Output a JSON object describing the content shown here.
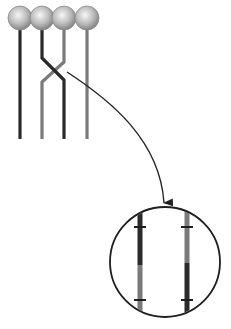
{
  "diagram": {
    "type": "genetics-crossing-over",
    "colors": {
      "dark_chromatid": "#2a2a2a",
      "light_chromatid": "#7a7a7a",
      "centromere_light": "#f4f4f4",
      "centromere_dark": "#8a8a8a",
      "arrow": "#222222",
      "circle_outline": "#1e1e1e",
      "background": "#ffffff"
    },
    "centromeres": [
      {
        "cx": 20,
        "cy": 18,
        "r": 12
      },
      {
        "cx": 42,
        "cy": 18,
        "r": 12
      },
      {
        "cx": 64,
        "cy": 18,
        "r": 12
      },
      {
        "cx": 87,
        "cy": 18,
        "r": 12
      }
    ],
    "chromatids": [
      {
        "name": "chromatid-1",
        "shade": "dark",
        "x": 20
      },
      {
        "name": "chromatid-2",
        "shade": "dark",
        "x": 42,
        "crosses_to": 64
      },
      {
        "name": "chromatid-3",
        "shade": "light",
        "x": 64,
        "crosses_to": 42
      },
      {
        "name": "chromatid-4",
        "shade": "light",
        "x": 87
      }
    ],
    "chiasma": {
      "x": 53,
      "y": 72
    },
    "magnified_view": {
      "cx": 165,
      "cy": 262,
      "r": 55,
      "recombinant_chromatids": [
        {
          "x": 140,
          "top_shade": "dark",
          "bottom_shade": "light",
          "switch_y": 265
        },
        {
          "x": 187,
          "top_shade": "light",
          "bottom_shade": "dark",
          "switch_y": 263
        }
      ],
      "gene_markers_y": [
        227,
        300
      ]
    }
  }
}
